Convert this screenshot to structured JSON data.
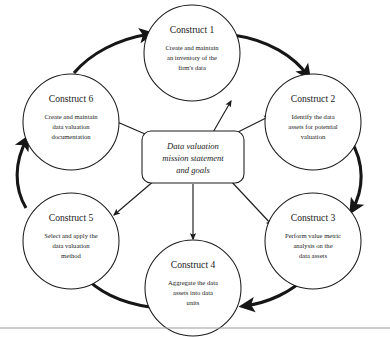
{
  "figure": {
    "type": "cycle-diagram",
    "center": {
      "lines": [
        "Data valuation",
        "mission statement",
        "and goals"
      ]
    },
    "nodes": [
      {
        "id": "construct-1",
        "title": "Construct 1",
        "desc_lines": [
          "Create and maintain",
          "an inventory of the",
          "firm's data"
        ],
        "position": "top"
      },
      {
        "id": "construct-2",
        "title": "Construct 2",
        "desc_lines": [
          "Identify the data",
          "assets for potential",
          "valuation"
        ],
        "position": "upper-right"
      },
      {
        "id": "construct-3",
        "title": "Construct 3",
        "desc_lines": [
          "Perform value metric",
          "analysis on the",
          "data assets"
        ],
        "position": "lower-right"
      },
      {
        "id": "construct-4",
        "title": "Construct 4",
        "desc_lines": [
          "Aggregate the data",
          "assets into data",
          "units"
        ],
        "position": "bottom"
      },
      {
        "id": "construct-5",
        "title": "Construct 5",
        "desc_lines": [
          "Select and apply the",
          "data valuation",
          "method"
        ],
        "position": "lower-left"
      },
      {
        "id": "construct-6",
        "title": "Construct 6",
        "desc_lines": [
          "Create and maintain",
          "data valuation",
          "documentation"
        ],
        "position": "upper-left"
      }
    ],
    "cycle_arrows": [
      {
        "from": "construct-1",
        "to": "construct-2",
        "style": "thick-arc"
      },
      {
        "from": "construct-2",
        "to": "construct-3",
        "style": "thick-arc"
      },
      {
        "from": "construct-3",
        "to": "construct-4",
        "style": "thick-arc"
      },
      {
        "from": "construct-4",
        "to": "construct-5",
        "style": "thick-arc"
      },
      {
        "from": "construct-5",
        "to": "construct-6",
        "style": "thick-arc"
      },
      {
        "from": "construct-6",
        "to": "construct-1",
        "style": "thick-arc"
      }
    ],
    "spokes": [
      {
        "from": "center",
        "to": "construct-1",
        "style": "thin-line"
      },
      {
        "from": "center",
        "to": "construct-2",
        "style": "thin-line"
      },
      {
        "from": "center",
        "to": "construct-3",
        "style": "thin-line"
      },
      {
        "from": "center",
        "to": "construct-4",
        "style": "thin-line"
      },
      {
        "from": "center",
        "to": "construct-5",
        "style": "thin-line"
      },
      {
        "from": "center",
        "to": "construct-6",
        "style": "thin-line"
      }
    ],
    "colors": {
      "background": "#ffffff",
      "stroke": "#1c1c1c",
      "arrow": "#161616",
      "text": "#1a1a1a",
      "rule": "#9a9a9a"
    }
  }
}
